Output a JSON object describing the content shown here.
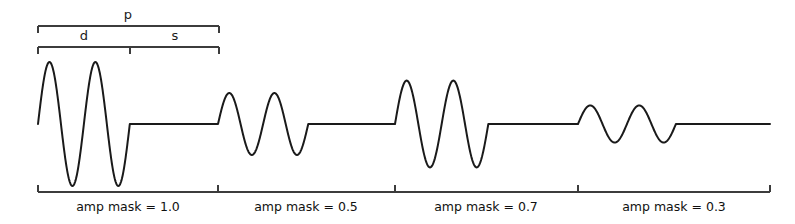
{
  "figure": {
    "width": 795,
    "height": 224,
    "background": "#ffffff",
    "wave_color": "#1a1a1a",
    "bracket_color": "#3c3c3c"
  },
  "top_brackets": [
    {
      "name": "period-bracket",
      "label": "p",
      "x_start": 38,
      "x_end": 219,
      "y": 26,
      "label_x": 128,
      "label_y": 8,
      "tick_height": 7,
      "dividers": []
    },
    {
      "name": "duration-silence-bracket",
      "labels": [
        "d",
        "s"
      ],
      "x_start": 38,
      "x_end": 219,
      "y": 47,
      "tick_height": 7,
      "dividers": [
        130
      ],
      "label_positions": [
        {
          "label": "d",
          "x": 84,
          "y": 29
        },
        {
          "label": "s",
          "x": 175,
          "y": 29
        }
      ]
    }
  ],
  "bottom_axis": {
    "name": "segment-axis",
    "y": 192,
    "x_start": 38,
    "x_end": 770,
    "tick_height": 7,
    "ticks": [
      38,
      218,
      395,
      578,
      770
    ],
    "label_y": 201
  },
  "segments": [
    {
      "label": "amp mask = 1.0",
      "amp": 1.0,
      "x_start": 38,
      "x_end": 218,
      "label_center": 128
    },
    {
      "label": "amp mask = 0.5",
      "amp": 0.5,
      "x_start": 218,
      "x_end": 395,
      "label_center": 306
    },
    {
      "label": "amp mask = 0.7",
      "amp": 0.7,
      "x_start": 395,
      "x_end": 578,
      "label_center": 486
    },
    {
      "label": "amp mask = 0.3",
      "amp": 0.3,
      "x_start": 578,
      "x_end": 770,
      "label_center": 674
    }
  ],
  "chart_data": {
    "type": "line",
    "title": "",
    "xlabel": "",
    "ylabel": "",
    "grid": false,
    "legend": false,
    "baseline_y": 124,
    "full_amplitude_px": 62,
    "period_px": 180,
    "oscillation_cycles_per_burst": 2,
    "burst_fraction_of_period": 0.51,
    "categories": [
      "amp mask = 1.0",
      "amp mask = 0.5",
      "amp mask = 0.7",
      "amp mask = 0.3"
    ],
    "values": [
      1.0,
      0.5,
      0.7,
      0.3
    ],
    "series": [
      {
        "name": "amp mask",
        "values": [
          1.0,
          0.5,
          0.7,
          0.3
        ]
      }
    ],
    "annotations": [
      {
        "text": "p",
        "meaning": "period",
        "span_px": [
          38,
          219
        ]
      },
      {
        "text": "d",
        "meaning": "duration of burst",
        "span_px": [
          38,
          130
        ]
      },
      {
        "text": "s",
        "meaning": "silence",
        "span_px": [
          130,
          219
        ]
      }
    ],
    "ylim": [
      -1.05,
      1.05
    ],
    "xlim": [
      38,
      770
    ]
  }
}
